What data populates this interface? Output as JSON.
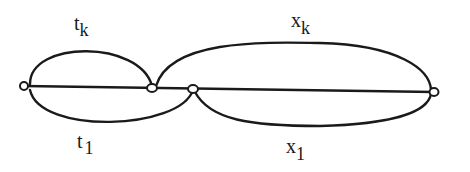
{
  "diagram": {
    "stroke_color": "#1a1a1a",
    "background": "#ffffff",
    "nodes": [
      {
        "id": "n1",
        "x": 24,
        "y": 86
      },
      {
        "id": "n2",
        "x": 152,
        "y": 88
      },
      {
        "id": "n3",
        "x": 193,
        "y": 89
      },
      {
        "id": "n4",
        "x": 434,
        "y": 92
      }
    ],
    "edges": [
      {
        "id": "baseline",
        "from": "n1",
        "to": "n4",
        "type": "straight"
      },
      {
        "id": "t_k",
        "from": "n1",
        "to": "n2",
        "type": "upper-arc"
      },
      {
        "id": "t_1",
        "from": "n1",
        "to": "n3",
        "type": "lower-arc"
      },
      {
        "id": "x_k",
        "from": "n2",
        "to": "n4",
        "type": "upper-arc"
      },
      {
        "id": "x_1",
        "from": "n3",
        "to": "n4",
        "type": "lower-arc"
      }
    ],
    "labels": {
      "t_k": {
        "base": "t",
        "sub": "k"
      },
      "t_1": {
        "base": "t",
        "sub": "1"
      },
      "x_k": {
        "base": "x",
        "sub": "k"
      },
      "x_1": {
        "base": "x",
        "sub": "1"
      }
    }
  }
}
